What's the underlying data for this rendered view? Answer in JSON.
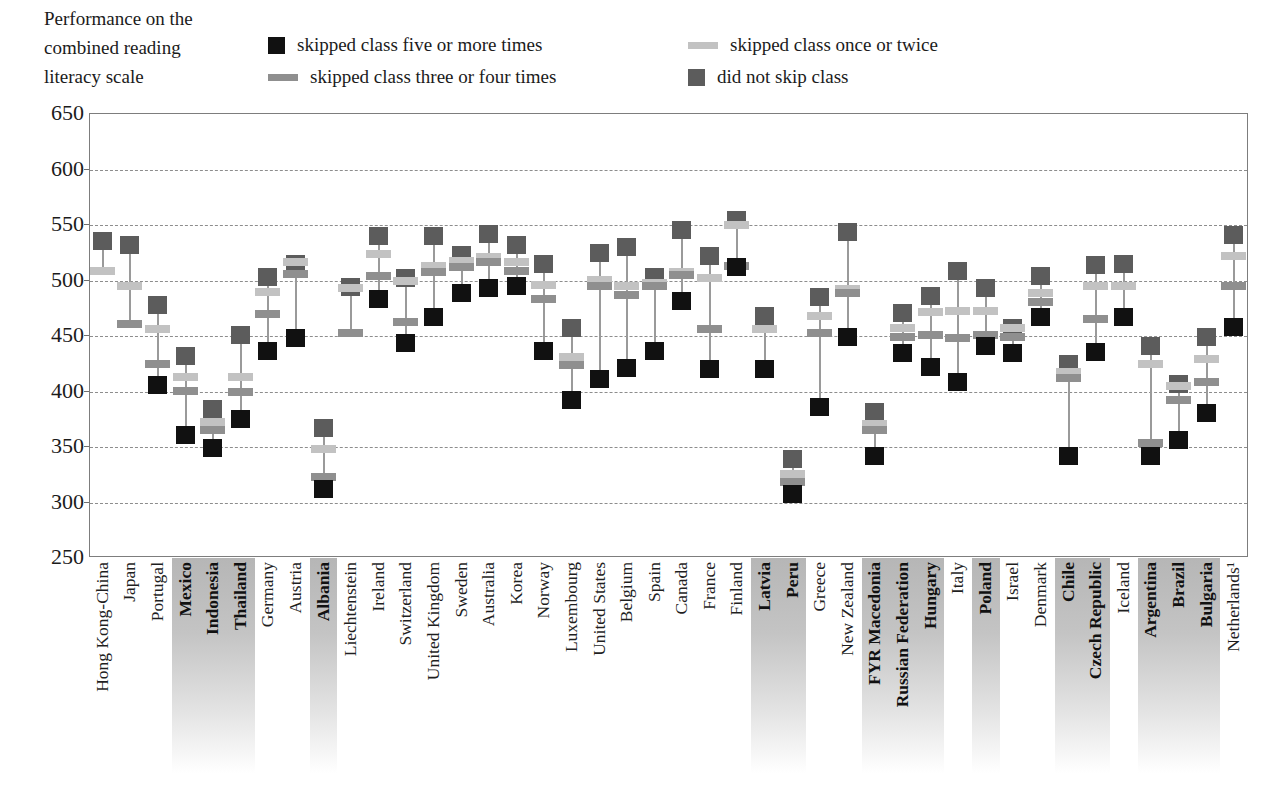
{
  "axis_title": "Performance on the combined reading literacy scale",
  "axis_title_lines": [
    "Performance on the",
    "combined reading",
    "literacy scale"
  ],
  "legend": [
    {
      "label": "skipped class five or more times",
      "marker": "square",
      "color": "#111111",
      "key": "five_or_more"
    },
    {
      "label": "skipped class three or four times",
      "marker": "bar",
      "color": "#8f8f8f",
      "key": "three_or_four"
    },
    {
      "label": "skipped class once or twice",
      "marker": "bar",
      "color": "#c2c2c2",
      "key": "once_or_twice"
    },
    {
      "label": "did not skip class",
      "marker": "square",
      "color": "#5c5c5c",
      "key": "did_not_skip"
    }
  ],
  "chart_data": {
    "type": "scatter",
    "title": "Performance on the combined reading literacy scale",
    "xlabel": "",
    "ylabel": "Performance on the combined reading literacy scale",
    "ylim": [
      250,
      650
    ],
    "ytick_step": 50,
    "yticks": [
      650,
      600,
      550,
      500,
      450,
      400,
      350,
      300,
      250
    ],
    "grid": true,
    "legend_position": "top",
    "series_order": [
      "did_not_skip",
      "once_or_twice",
      "three_or_four",
      "five_or_more"
    ],
    "series_colors": {
      "five_or_more": "#111111",
      "three_or_four": "#8f8f8f",
      "once_or_twice": "#c2c2c2",
      "did_not_skip": "#5c5c5c"
    },
    "series_markers": {
      "five_or_more": "square",
      "three_or_four": "bar",
      "once_or_twice": "bar",
      "did_not_skip": "square"
    },
    "categories": [
      "Hong Kong-China",
      "Japan",
      "Portugal",
      "Mexico",
      "Indonesia",
      "Thailand",
      "Germany",
      "Austria",
      "Albania",
      "Liechtenstein",
      "Ireland",
      "Switzerland",
      "United Kingdom",
      "Sweden",
      "Australia",
      "Korea",
      "Norway",
      "Luxembourg",
      "United States",
      "Belgium",
      "Spain",
      "Canada",
      "France",
      "Finland",
      "Latvia",
      "Peru",
      "Greece",
      "New Zealand",
      "FYR Macedonia",
      "Russian Federation",
      "Hungary",
      "Italy",
      "Poland",
      "Israel",
      "Denmark",
      "Chile",
      "Czech Republic",
      "Iceland",
      "Argentina",
      "Brazil",
      "Bulgaria",
      "Netherlands¹"
    ],
    "highlighted_categories": [
      "Mexico",
      "Indonesia",
      "Thailand",
      "Albania",
      "Latvia",
      "Peru",
      "FYR Macedonia",
      "Russian Federation",
      "Hungary",
      "Poland",
      "Chile",
      "Czech Republic",
      "Argentina",
      "Brazil",
      "Bulgaria"
    ],
    "points": [
      {
        "country": "Hong Kong-China",
        "did_not_skip": 535,
        "once_or_twice": 508,
        "three_or_four": null,
        "five_or_more": null
      },
      {
        "country": "Japan",
        "did_not_skip": 531,
        "once_or_twice": 494,
        "three_or_four": 460,
        "five_or_more": null
      },
      {
        "country": "Portugal",
        "did_not_skip": 477,
        "once_or_twice": 455,
        "three_or_four": 424,
        "five_or_more": 405
      },
      {
        "country": "Mexico",
        "did_not_skip": 431,
        "once_or_twice": 412,
        "three_or_four": 400,
        "five_or_more": 360
      },
      {
        "country": "Indonesia",
        "did_not_skip": 383,
        "once_or_twice": 372,
        "three_or_four": 364,
        "five_or_more": 348
      },
      {
        "country": "Thailand",
        "did_not_skip": 450,
        "once_or_twice": 412,
        "three_or_four": 399,
        "five_or_more": 374
      },
      {
        "country": "Germany",
        "did_not_skip": 502,
        "once_or_twice": 489,
        "three_or_four": 469,
        "five_or_more": 436
      },
      {
        "country": "Austria",
        "did_not_skip": 514,
        "once_or_twice": 516,
        "three_or_four": 505,
        "five_or_more": 447
      },
      {
        "country": "Albania",
        "did_not_skip": 366,
        "once_or_twice": 347,
        "three_or_four": 322,
        "five_or_more": 311
      },
      {
        "country": "Liechtenstein",
        "did_not_skip": 493,
        "once_or_twice": 492,
        "three_or_four": 452,
        "five_or_more": null
      },
      {
        "country": "Ireland",
        "did_not_skip": 539,
        "once_or_twice": 523,
        "three_or_four": 503,
        "five_or_more": 482
      },
      {
        "country": "Switzerland",
        "did_not_skip": 501,
        "once_or_twice": 499,
        "three_or_four": 462,
        "five_or_more": 443
      },
      {
        "country": "United Kingdom",
        "did_not_skip": 539,
        "once_or_twice": 512,
        "three_or_four": 507,
        "five_or_more": 466
      },
      {
        "country": "Sweden",
        "did_not_skip": 522,
        "once_or_twice": 517,
        "three_or_four": 511,
        "five_or_more": 488
      },
      {
        "country": "Australia",
        "did_not_skip": 541,
        "once_or_twice": 520,
        "three_or_four": 516,
        "five_or_more": 492
      },
      {
        "country": "Korea",
        "did_not_skip": 531,
        "once_or_twice": 516,
        "three_or_four": 508,
        "five_or_more": 494
      },
      {
        "country": "Norway",
        "did_not_skip": 514,
        "once_or_twice": 495,
        "three_or_four": 482,
        "five_or_more": 436
      },
      {
        "country": "Luxembourg",
        "did_not_skip": 456,
        "once_or_twice": 430,
        "three_or_four": 423,
        "five_or_more": 391
      },
      {
        "country": "United States",
        "did_not_skip": 524,
        "once_or_twice": 500,
        "three_or_four": 494,
        "five_or_more": 410
      },
      {
        "country": "Belgium",
        "did_not_skip": 529,
        "once_or_twice": 494,
        "three_or_four": 486,
        "five_or_more": 420
      },
      {
        "country": "Spain",
        "did_not_skip": 502,
        "once_or_twice": 497,
        "three_or_four": 494,
        "five_or_more": 436
      },
      {
        "country": "Canada",
        "did_not_skip": 545,
        "once_or_twice": 507,
        "three_or_four": 504,
        "five_or_more": 481
      },
      {
        "country": "France",
        "did_not_skip": 521,
        "once_or_twice": 501,
        "three_or_four": 455,
        "five_or_more": 419
      },
      {
        "country": "Finland",
        "did_not_skip": 554,
        "once_or_twice": 549,
        "three_or_four": 512,
        "five_or_more": 511
      },
      {
        "country": "Latvia",
        "did_not_skip": 467,
        "once_or_twice": 455,
        "three_or_four": null,
        "five_or_more": 419
      },
      {
        "country": "Peru",
        "did_not_skip": 338,
        "once_or_twice": 325,
        "three_or_four": 318,
        "five_or_more": 307
      },
      {
        "country": "Greece",
        "did_not_skip": 484,
        "once_or_twice": 467,
        "three_or_four": 452,
        "five_or_more": 385
      },
      {
        "country": "New Zealand",
        "did_not_skip": 543,
        "once_or_twice": 491,
        "three_or_four": 488,
        "five_or_more": 448
      },
      {
        "country": "FYR Macedonia",
        "did_not_skip": 381,
        "once_or_twice": 370,
        "three_or_four": 364,
        "five_or_more": 341
      },
      {
        "country": "Russian Federation",
        "did_not_skip": 470,
        "once_or_twice": 456,
        "three_or_four": 448,
        "five_or_more": 434
      },
      {
        "country": "Hungary",
        "did_not_skip": 485,
        "once_or_twice": 471,
        "three_or_four": 450,
        "five_or_more": 421
      },
      {
        "country": "Italy",
        "did_not_skip": 508,
        "once_or_twice": 472,
        "three_or_four": 447,
        "five_or_more": 408
      },
      {
        "country": "Poland",
        "did_not_skip": 492,
        "once_or_twice": 472,
        "three_or_four": 450,
        "five_or_more": 440
      },
      {
        "country": "Israel",
        "did_not_skip": 456,
        "once_or_twice": 456,
        "three_or_four": 448,
        "five_or_more": 434
      },
      {
        "country": "Denmark",
        "did_not_skip": 503,
        "once_or_twice": 488,
        "three_or_four": 480,
        "five_or_more": 466
      },
      {
        "country": "Chile",
        "did_not_skip": 424,
        "once_or_twice": 417,
        "three_or_four": 411,
        "five_or_more": 341
      },
      {
        "country": "Czech Republic",
        "did_not_skip": 513,
        "once_or_twice": 494,
        "three_or_four": 464,
        "five_or_more": 435
      },
      {
        "country": "Iceland",
        "did_not_skip": 514,
        "once_or_twice": 494,
        "three_or_four": null,
        "five_or_more": 466
      },
      {
        "country": "Argentina",
        "did_not_skip": 440,
        "once_or_twice": 424,
        "three_or_four": 353,
        "five_or_more": 341
      },
      {
        "country": "Brazil",
        "did_not_skip": 406,
        "once_or_twice": 404,
        "three_or_four": 391,
        "five_or_more": 355
      },
      {
        "country": "Bulgaria",
        "did_not_skip": 448,
        "once_or_twice": 428,
        "three_or_four": 408,
        "five_or_more": 380
      },
      {
        "country": "Netherlands¹",
        "did_not_skip": 540,
        "once_or_twice": 521,
        "three_or_four": 494,
        "five_or_more": 457
      }
    ]
  }
}
